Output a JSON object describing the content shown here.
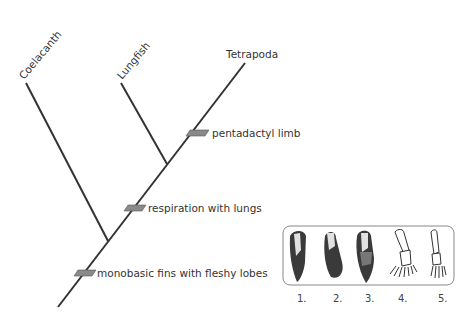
{
  "diagram": {
    "type": "cladogram",
    "taxa": [
      {
        "id": "coelacanth",
        "label": "Coelacanth"
      },
      {
        "id": "lungfish",
        "label": "Lungfish"
      },
      {
        "id": "tetrapoda",
        "label": "Tetrapoda"
      }
    ],
    "characters": [
      {
        "id": "pentadactyl",
        "label": "pentadactyl limb"
      },
      {
        "id": "lungs",
        "label": "respiration with lungs"
      },
      {
        "id": "fins",
        "label": "monobasic fins with fleshy lobes"
      }
    ],
    "limb_figures": {
      "labels": [
        "1.",
        "2.",
        "3.",
        "4.",
        "5."
      ]
    },
    "colors": {
      "line": "#333333",
      "marker": "#8a8a8a",
      "box_border": "#888888"
    }
  }
}
